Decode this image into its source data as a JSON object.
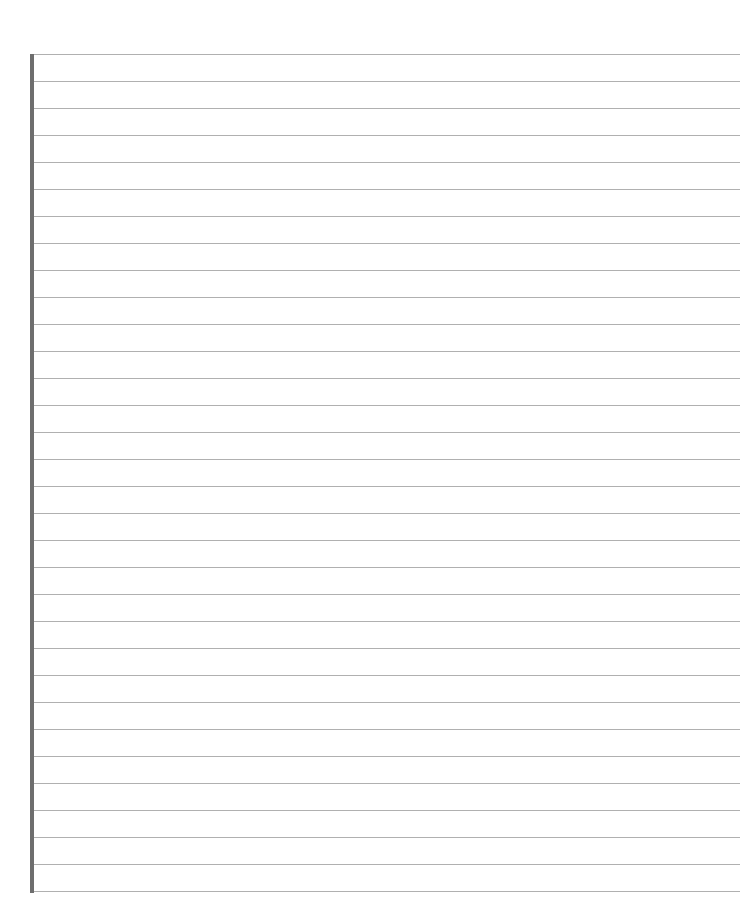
{
  "page": {
    "type": "lined-paper",
    "background_color": "#ffffff",
    "margin_bar": {
      "color": "#6e6e6e",
      "left": 30,
      "top": 54,
      "width": 4,
      "height": 839
    },
    "rules": {
      "count": 32,
      "first_y": 54,
      "spacing": 27,
      "left": 34,
      "width": 706,
      "color": "#b0b0b0"
    }
  }
}
